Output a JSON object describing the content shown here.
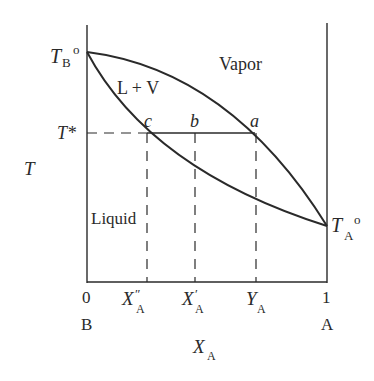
{
  "diagram": {
    "type": "phase-diagram",
    "axes": {
      "y_label": "T",
      "x_label_main": "X",
      "x_label_sub": "A",
      "x_left_value": "0",
      "x_left_component": "B",
      "x_right_value": "1",
      "x_right_component": "A"
    },
    "x_ticks": [
      {
        "main": "X",
        "sub": "A",
        "prime": "″"
      },
      {
        "main": "X",
        "sub": "A",
        "prime": "′"
      },
      {
        "main": "Y",
        "sub": "A",
        "prime": ""
      }
    ],
    "y_markers": {
      "tb": {
        "main": "T",
        "sub": "B",
        "sup": "o"
      },
      "ta": {
        "main": "T",
        "sub": "A",
        "sup": "o"
      },
      "tstar": "T*"
    },
    "regions": {
      "vapor": "Vapor",
      "two_phase": "L + V",
      "liquid": "Liquid"
    },
    "points": {
      "c": "c",
      "b": "b",
      "a": "a"
    },
    "colors": {
      "line": "#2a2a2a",
      "background": "#ffffff"
    }
  }
}
